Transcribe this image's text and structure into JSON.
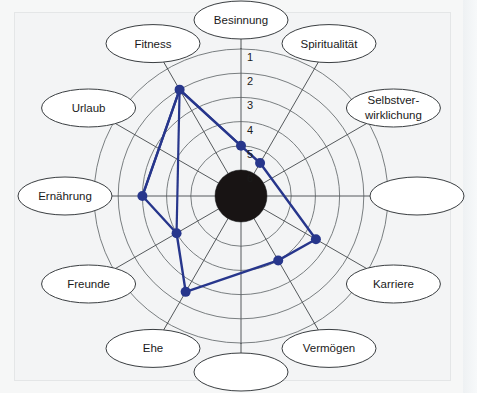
{
  "figure": {
    "kind": "wheel-of-life-radar",
    "background_color": "#f3f4f5",
    "axis_line_color": "#55595c",
    "grid_line_color": "#6b7073",
    "ellipse_fill": "#ffffff",
    "ellipse_stroke": "#3a3e41",
    "hub_color": "#181414",
    "data_color": "#27368c",
    "data_point_color": "#27368c",
    "text_color": "#1a1a1a"
  },
  "scale": {
    "labels": [
      "1",
      "2",
      "3",
      "4",
      "5",
      "6"
    ],
    "min": 1,
    "max": 6,
    "note": "1 = outermost ring, 6 = innermost ring"
  },
  "chart_data": {
    "type": "radar",
    "title": "",
    "xlabel": "",
    "ylabel": "",
    "rlim": [
      1,
      6
    ],
    "grid": true,
    "legend": "none",
    "rings": [
      "1",
      "2",
      "3",
      "4",
      "5",
      "6"
    ],
    "categories": [
      "Besinnung",
      "Spiritualität",
      "Selbstver-\nwirklichung",
      "",
      "Karriere",
      "Vermögen",
      "",
      "Ehe",
      "Freunde",
      "Ernährung",
      "Urlaub",
      "Fitness"
    ],
    "series": [
      {
        "name": "Bewertung",
        "values": [
          5,
          5.5,
          null,
          null,
          3.5,
          4,
          null,
          2.5,
          null,
          3,
          null,
          2
        ]
      }
    ],
    "points": [
      {
        "category": "Besinnung",
        "angle_deg": 0,
        "value": 5,
        "marker": true
      },
      {
        "category": "Spiritualität",
        "angle_deg": 30,
        "value": 5.5,
        "marker": true
      },
      {
        "category": "Karriere",
        "angle_deg": 120,
        "value": 3.5,
        "marker": true
      },
      {
        "category": "Vermögen",
        "angle_deg": 150,
        "value": 4,
        "marker": true
      },
      {
        "category": "Ehe",
        "angle_deg": 210,
        "value": 2.5,
        "marker": true
      },
      {
        "category": "Freunde",
        "angle_deg": 240,
        "value": 4,
        "marker": true
      },
      {
        "category": "Ernährung",
        "angle_deg": 270,
        "value": 3,
        "marker": true
      },
      {
        "category": "Fitness",
        "angle_deg": 330,
        "value": 2,
        "marker": true
      }
    ]
  },
  "sectors": [
    {
      "id": "sector-besinnung",
      "label": "Besinnung",
      "label_line_2": "",
      "empty": false
    },
    {
      "id": "sector-spiritualitaet",
      "label": "Spiritualität",
      "label_line_2": "",
      "empty": false
    },
    {
      "id": "sector-selbstverwirklichung",
      "label": "Selbstver-",
      "label_line_2": "wirklichung",
      "empty": false
    },
    {
      "id": "sector-unlabeled-right",
      "label": "",
      "label_line_2": "",
      "empty": true
    },
    {
      "id": "sector-karriere",
      "label": "Karriere",
      "label_line_2": "",
      "empty": false
    },
    {
      "id": "sector-vermoegen",
      "label": "Vermögen",
      "label_line_2": "",
      "empty": false
    },
    {
      "id": "sector-unlabeled-bottom",
      "label": "",
      "label_line_2": "",
      "empty": true
    },
    {
      "id": "sector-ehe",
      "label": "Ehe",
      "label_line_2": "",
      "empty": false
    },
    {
      "id": "sector-freunde",
      "label": "Freunde",
      "label_line_2": "",
      "empty": false
    },
    {
      "id": "sector-ernaehrung",
      "label": "Ernährung",
      "label_line_2": "",
      "empty": false
    },
    {
      "id": "sector-urlaub",
      "label": "Urlaub",
      "label_line_2": "",
      "empty": false
    },
    {
      "id": "sector-fitness",
      "label": "Fitness",
      "label_line_2": "",
      "empty": false
    }
  ]
}
